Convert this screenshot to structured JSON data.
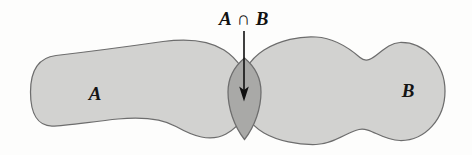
{
  "figure": {
    "type": "venn-diagram",
    "title": "",
    "background_color": "#fdfdfc",
    "sets": [
      {
        "id": "A",
        "label": "A",
        "label_x": 95,
        "label_y": 95,
        "fill_color": "#d2d2d0",
        "stroke_color": "#6d6d6d"
      },
      {
        "id": "B",
        "label": "B",
        "label_x": 408,
        "label_y": 92,
        "fill_color": "#d2d2d0",
        "stroke_color": "#6d6d6d"
      }
    ],
    "intersection": {
      "label": "A ∩ B",
      "label_x": 244,
      "label_y": 22,
      "fill_color": "#a9a9a7",
      "stroke_color": "#6d6d6d",
      "arrow": {
        "from_x": 244,
        "from_y": 30,
        "to_x": 244,
        "to_y": 101,
        "color": "#101010"
      }
    }
  },
  "geometry": {
    "blob_a_path": "M 30.5 92 C 30.5 70 39 57.5 56 55.5 C 86 52 128 46.5 163 41.5 C 189 38 210 41 224 50 C 238 59 248 74 249 92 C 250 110 241 126 226 134 C 210 142.5 193 136 176 126.5 C 160 117.5 140 117 118 119 C 92 121.5 66 126 52 126 C 38 126 30.5 114 30.5 92 Z",
    "blob_b_path": "M 240 92 C 240 74 250 59 264 50 C 280 40 300 36 316 37 C 334 38 348 47 360 57.5 C 372 68 382 43 400 42.5 C 424 42 445 63 445 91 C 445 119 425 141 400 140.5 C 381 140 371 127 359 129.5 C 347 132 334 144 316 144.5 C 298 145 278 141 264 133 C 250 125 240 110 240 92 Z",
    "lens_path": "M 244.5 58 C 254 66 261 78 261 92 C 261 108 255 126 244.5 139.5 C 234 126 228 108 228 92 C 228 78 235 66 244.5 58 Z"
  }
}
